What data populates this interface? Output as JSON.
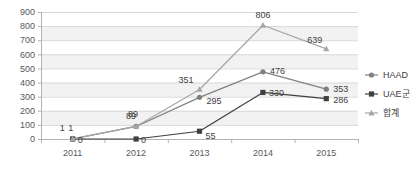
{
  "chart_data": {
    "type": "line",
    "title": "",
    "subtitle": "",
    "xlabel": "",
    "ylabel": "",
    "categories": [
      "2011",
      "2012",
      "2013",
      "2014",
      "2015"
    ],
    "ylim": [
      0,
      900
    ],
    "ytick_step": 100,
    "yticks": [
      "0",
      "100",
      "200",
      "300",
      "400",
      "500",
      "600",
      "700",
      "800",
      "900"
    ],
    "grid": true,
    "grid_bands": true,
    "legend_position": "right",
    "series": [
      {
        "name": "HAAD",
        "marker": "circle",
        "color": "#808080",
        "values": [
          1,
          89,
          295,
          476,
          353
        ],
        "labels": [
          "1",
          "89",
          "295",
          "476",
          "353"
        ]
      },
      {
        "name": "UAE군",
        "marker": "square",
        "color": "#404040",
        "values": [
          0,
          0,
          55,
          330,
          286
        ],
        "labels": [
          "0",
          "0",
          "55",
          "330",
          "286"
        ]
      },
      {
        "name": "합계",
        "marker": "triangle",
        "color": "#a6a6a6",
        "values": [
          1,
          89,
          351,
          806,
          639
        ],
        "labels": [
          "1",
          "89",
          "351",
          "806",
          "639"
        ]
      }
    ]
  },
  "legend": {
    "items": [
      {
        "label": "HAAD"
      },
      {
        "label": "UAE군"
      },
      {
        "label": "합계"
      }
    ]
  },
  "axes": {
    "y": {
      "ticks": [
        "900",
        "800",
        "700",
        "600",
        "500",
        "400",
        "300",
        "200",
        "100",
        "0"
      ]
    },
    "x": {
      "ticks": [
        "2011",
        "2012",
        "2013",
        "2014",
        "2015"
      ]
    }
  },
  "colors": {
    "haad": "#808080",
    "uae": "#404040",
    "total": "#a6a6a6",
    "axis": "#b3b3b3",
    "grid": "#d9d9d9",
    "band": "#f2f2f2",
    "text": "#595959"
  }
}
